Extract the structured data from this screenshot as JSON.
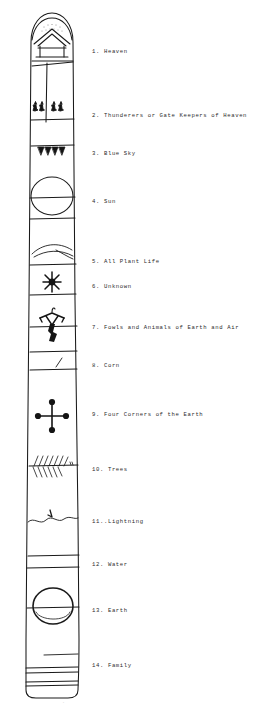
{
  "document": {
    "title": "Totem Pole Symbol Key",
    "ink_color": "#1a1a1a",
    "background_color": "#ffffff",
    "caption_text": "."
  },
  "legend": {
    "items": [
      {
        "number": "1.",
        "label": "Heaven",
        "text": "1. Heaven",
        "y": 48
      },
      {
        "number": "2.",
        "label": "Thunderers or Gate Keepers of Heaven",
        "text": "2. Thunderers or Gate Keepers of Heaven",
        "y": 112
      },
      {
        "number": "3.",
        "label": "Blue Sky",
        "text": "3. Blue Sky",
        "y": 150
      },
      {
        "number": "4.",
        "label": "Sun",
        "text": "4. Sun",
        "y": 198
      },
      {
        "number": "5.",
        "label": "All Plant Life",
        "text": "5. All Plant Life",
        "y": 258
      },
      {
        "number": "6.",
        "label": "Unknown",
        "text": "6. Unknown",
        "y": 283
      },
      {
        "number": "7.",
        "label": "Fowls and Animals of Earth and Air",
        "text": "7. Fowls and Animals of Earth and Air",
        "y": 324
      },
      {
        "number": "8.",
        "label": "Corn",
        "text": "8. Corn",
        "y": 362
      },
      {
        "number": "9.",
        "label": "Four Corners of the Earth",
        "text": "9. Four Corners of the Earth",
        "y": 411
      },
      {
        "number": "10.",
        "label": "Trees",
        "text": "10. Trees",
        "y": 466
      },
      {
        "number": "11.",
        "label": "Lightning",
        "text": "11..Lightning",
        "y": 518
      },
      {
        "number": "12.",
        "label": "Water",
        "text": "12. Water",
        "y": 561
      },
      {
        "number": "13.",
        "label": "Earth",
        "text": "13. Earth",
        "y": 607
      },
      {
        "number": "14.",
        "label": "Family",
        "text": "14. Family",
        "y": 662
      }
    ]
  },
  "totem": {
    "sections": [
      {
        "id": 1,
        "name": "heaven",
        "symbol": "dome-with-house-peak"
      },
      {
        "id": 2,
        "name": "thunderers",
        "symbol": "four-thunderbird-figures"
      },
      {
        "id": 3,
        "name": "blue-sky",
        "symbol": "row-of-downward-triangles"
      },
      {
        "id": 4,
        "name": "sun",
        "symbol": "large-circle"
      },
      {
        "id": 5,
        "name": "all-plant-life",
        "symbol": "curved-leaf-strokes"
      },
      {
        "id": 6,
        "name": "unknown",
        "symbol": "filled-star-asterisk"
      },
      {
        "id": 7,
        "name": "fowls-animals",
        "symbol": "bird-animal-figure"
      },
      {
        "id": 8,
        "name": "corn",
        "symbol": "short-diagonal-stroke"
      },
      {
        "id": 9,
        "name": "four-corners",
        "symbol": "cross-with-four-dots"
      },
      {
        "id": 10,
        "name": "trees",
        "symbol": "hatched-branch-line"
      },
      {
        "id": 11,
        "name": "lightning",
        "symbol": "wavy-line-with-bolt"
      },
      {
        "id": 12,
        "name": "water",
        "symbol": "blank-band"
      },
      {
        "id": 13,
        "name": "earth",
        "symbol": "large-circle-over-line"
      },
      {
        "id": 14,
        "name": "family",
        "symbol": "stacked-horizontal-lines"
      }
    ]
  }
}
